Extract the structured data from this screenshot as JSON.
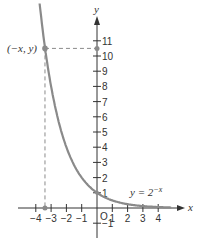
{
  "chart_data": {
    "type": "line",
    "title": "",
    "xlabel": "x",
    "ylabel": "y",
    "function": "y = 2^-x",
    "curve_label": "y = 2",
    "curve_label_exp": "−x",
    "xlim": [
      -4.5,
      5
    ],
    "ylim": [
      -1.5,
      12
    ],
    "x_ticks": [
      -4,
      -3,
      -2,
      -1,
      1,
      2,
      3,
      4
    ],
    "x_tick_labels": [
      "−4",
      "−3",
      "−2",
      "−1",
      "1",
      "2",
      "3",
      "4"
    ],
    "y_ticks": [
      -1,
      1,
      2,
      3,
      4,
      5,
      6,
      7,
      8,
      9,
      10,
      11
    ],
    "y_tick_labels": [
      "−1",
      "1",
      "2",
      "3",
      "4",
      "5",
      "6",
      "7",
      "8",
      "9",
      "10",
      "11"
    ],
    "origin_label": "O",
    "highlighted_point": {
      "label": "(−x, y)",
      "x": -3.4,
      "y": 10.5
    },
    "series": [
      {
        "name": "y = 2^-x",
        "x": [
          -3.7,
          -3.4,
          -3,
          -2,
          -1,
          0,
          1,
          2,
          3,
          4,
          4.8
        ],
        "y": [
          13.0,
          10.5,
          8,
          4,
          2,
          1,
          0.5,
          0.25,
          0.125,
          0.0625,
          0.036
        ]
      }
    ],
    "grid": false,
    "colors": {
      "curve": "#8a8a8a",
      "axis": "#333333",
      "guide": "#8a8a8a"
    }
  }
}
